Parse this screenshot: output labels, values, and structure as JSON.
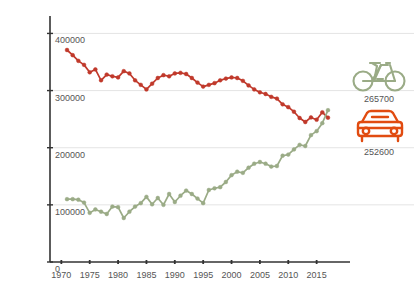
{
  "chart_data": {
    "type": "line",
    "title": "",
    "subtitle": "",
    "xlabel": "",
    "ylabel": "",
    "xlim": [
      1968,
      2020
    ],
    "ylim": [
      0,
      420000
    ],
    "grid": true,
    "legend_position": "right-inline-icons",
    "y_ticks": [
      0,
      100000,
      200000,
      300000,
      400000
    ],
    "y_tick_labels": [
      "0",
      "100000",
      "200000",
      "300000",
      "400000"
    ],
    "x_ticks": [
      1970,
      1975,
      1980,
      1985,
      1990,
      1995,
      2000,
      2005,
      2010,
      2015
    ],
    "x_tick_labels": [
      "1970",
      "1975",
      "1980",
      "1985",
      "1990",
      "1995",
      "2000",
      "2005",
      "2010",
      "2015"
    ],
    "series": [
      {
        "name": "car",
        "icon": "car-icon",
        "color": "#c0392b",
        "marker": "circle",
        "end_label": "252600",
        "x": [
          1971,
          1972,
          1973,
          1974,
          1975,
          1976,
          1977,
          1978,
          1979,
          1980,
          1981,
          1982,
          1983,
          1984,
          1985,
          1986,
          1987,
          1988,
          1989,
          1990,
          1991,
          1992,
          1993,
          1994,
          1995,
          1996,
          1997,
          1998,
          1999,
          2000,
          2001,
          2002,
          2003,
          2004,
          2005,
          2006,
          2007,
          2008,
          2009,
          2010,
          2011,
          2012,
          2013,
          2014,
          2015,
          2016,
          2017
        ],
        "values": [
          371000,
          362000,
          352000,
          345000,
          332000,
          337000,
          318000,
          328000,
          325000,
          323000,
          334000,
          330000,
          318000,
          310000,
          302000,
          312000,
          322000,
          327000,
          325000,
          330000,
          331000,
          329000,
          322000,
          314000,
          307000,
          310000,
          313000,
          318000,
          321000,
          323000,
          322000,
          317000,
          309000,
          302000,
          297000,
          294000,
          289000,
          286000,
          276000,
          271000,
          263000,
          252000,
          245000,
          253000,
          249000,
          262000,
          252600
        ]
      },
      {
        "name": "bicycle",
        "icon": "bicycle-icon",
        "color": "#9aab86",
        "marker": "circle",
        "end_label": "265700",
        "x": [
          1971,
          1972,
          1973,
          1974,
          1975,
          1976,
          1977,
          1978,
          1979,
          1980,
          1981,
          1982,
          1983,
          1984,
          1985,
          1986,
          1987,
          1988,
          1989,
          1990,
          1991,
          1992,
          1993,
          1994,
          1995,
          1996,
          1997,
          1998,
          1999,
          2000,
          2001,
          2002,
          2003,
          2004,
          2005,
          2006,
          2007,
          2008,
          2009,
          2010,
          2011,
          2012,
          2013,
          2014,
          2015,
          2016,
          2017
        ],
        "values": [
          110000,
          110000,
          109000,
          104000,
          86000,
          92000,
          88000,
          84000,
          97000,
          96000,
          77000,
          88000,
          97000,
          103000,
          114000,
          101000,
          112000,
          100000,
          119000,
          105000,
          116000,
          125000,
          119000,
          111000,
          103000,
          126000,
          129000,
          131000,
          140000,
          152000,
          158000,
          156000,
          165000,
          172000,
          175000,
          172000,
          167000,
          168000,
          186000,
          188000,
          197000,
          205000,
          203000,
          222000,
          229000,
          243000,
          265700
        ]
      }
    ]
  },
  "axis": {
    "y_axis_name": "y-axis",
    "x_axis_name": "x-axis"
  }
}
